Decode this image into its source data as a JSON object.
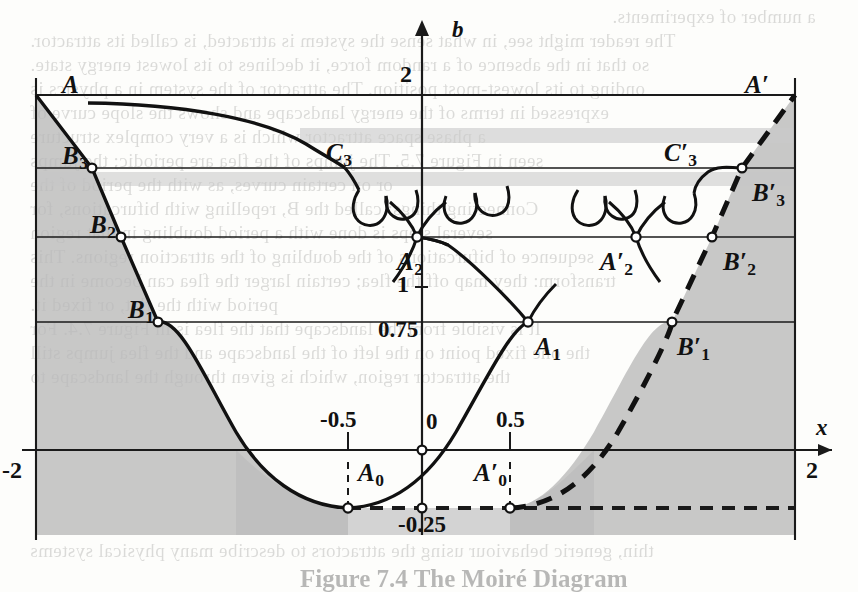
{
  "figure": {
    "caption": "Figure 7.4 The Moiré Diagram",
    "axis_x_name": "x",
    "axis_b_name": "b"
  },
  "axes": {
    "x_ticks": [
      {
        "label": "-2",
        "x": -2,
        "pos": 36,
        "side": "left"
      },
      {
        "label": "-0.5",
        "x": -0.5,
        "pos": 348,
        "side": "tick"
      },
      {
        "label": "0",
        "x": 0,
        "pos": 422,
        "side": "origin"
      },
      {
        "label": "0.5",
        "x": 0.5,
        "pos": 510,
        "side": "tick"
      },
      {
        "label": "2",
        "x": 2,
        "pos": 795,
        "side": "right"
      }
    ],
    "b_ticks": [
      {
        "label": "2",
        "b": 2,
        "pos": 95
      },
      {
        "label": "1",
        "b": 1,
        "pos": 287
      },
      {
        "label": "0.75",
        "b": 0.75,
        "pos": 331
      },
      {
        "label": "0",
        "b": 0,
        "pos": 450
      },
      {
        "label": "-0.25",
        "b": -0.25,
        "pos": 508
      }
    ]
  },
  "levels": [
    {
      "name": "b = 2",
      "y": 95,
      "style": "solid"
    },
    {
      "name": "B3-level",
      "y": 168,
      "style": "solid"
    },
    {
      "name": "B2-level",
      "y": 237,
      "style": "solid"
    },
    {
      "name": "B1-level",
      "y": 322,
      "style": "solid"
    },
    {
      "name": "x-axis",
      "y": 450,
      "style": "solid-arrow"
    },
    {
      "name": "b = -0.25",
      "y": 508,
      "style": "dashed"
    }
  ],
  "points": [
    {
      "label": "A",
      "prime": false,
      "x": 36,
      "y": 95,
      "lx": 62,
      "ly": 72,
      "marker": false
    },
    {
      "label": "A",
      "prime": true,
      "x": 795,
      "y": 95,
      "lx": 745,
      "ly": 72,
      "marker": false
    },
    {
      "label": "B",
      "sub": "3",
      "prime": false,
      "x": 92,
      "y": 168,
      "lx": 62,
      "ly": 143,
      "marker": true
    },
    {
      "label": "B",
      "sub": "3",
      "prime": true,
      "x": 742,
      "y": 168,
      "lx": 752,
      "ly": 180,
      "marker": true
    },
    {
      "label": "B",
      "sub": "2",
      "prime": false,
      "x": 121,
      "y": 237,
      "lx": 90,
      "ly": 212,
      "marker": true
    },
    {
      "label": "B",
      "sub": "2",
      "prime": true,
      "x": 712,
      "y": 237,
      "lx": 723,
      "ly": 249,
      "marker": true
    },
    {
      "label": "B",
      "sub": "1",
      "prime": false,
      "x": 158,
      "y": 322,
      "lx": 128,
      "ly": 297,
      "marker": true
    },
    {
      "label": "B",
      "sub": "1",
      "prime": true,
      "x": 672,
      "y": 322,
      "lx": 677,
      "ly": 334,
      "marker": true
    },
    {
      "label": "C",
      "sub": "3",
      "prime": false,
      "x": 345,
      "y": 168,
      "lx": 326,
      "ly": 140,
      "marker": false
    },
    {
      "label": "C",
      "sub": "3",
      "prime": true,
      "x": 690,
      "y": 168,
      "lx": 664,
      "ly": 140,
      "marker": false
    },
    {
      "label": "A",
      "sub": "2",
      "prime": false,
      "x": 417,
      "y": 237,
      "lx": 397,
      "ly": 249,
      "marker": true
    },
    {
      "label": "A",
      "sub": "2",
      "prime": true,
      "x": 636,
      "y": 237,
      "lx": 600,
      "ly": 249,
      "marker": true
    },
    {
      "label": "A",
      "sub": "1",
      "prime": false,
      "x": 528,
      "y": 322,
      "lx": 535,
      "ly": 334,
      "marker": true
    },
    {
      "label": "A",
      "sub": "0",
      "prime": false,
      "x": 348,
      "y": 508,
      "lx": 358,
      "ly": 460,
      "marker": true
    },
    {
      "label": "A",
      "sub": "0",
      "prime": true,
      "x": 510,
      "y": 508,
      "lx": 474,
      "ly": 460,
      "marker": true
    }
  ],
  "chart_data": {
    "type": "line",
    "title": "Figure 7.4 The Moiré Diagram",
    "xlabel": "x",
    "ylabel": "b",
    "xlim": [
      -2,
      2
    ],
    "ylim": [
      -0.25,
      2
    ],
    "grid": false,
    "legend": null,
    "series": [
      {
        "name": "principal-parabola-solid",
        "note": "solid curve b = x^2 - ... descending from A at (-2,2) to minimum A0 at (-0.5,-0.25) then rising through origin",
        "style": "solid"
      },
      {
        "name": "mirror-parabola-dashed",
        "note": "dashed mirror curve from A'0 at (0.5,-0.25) rising to A' at (2,2)",
        "style": "dashed"
      },
      {
        "name": "period-doubling-forks",
        "note": "pitchfork bifurcation arcs between b-levels 0.75, 1, B2-level and B3-level",
        "style": "solid"
      }
    ],
    "shaded_regions": [
      {
        "name": "left-escape-region",
        "note": "grey fill left of descending solid curve"
      },
      {
        "name": "right-escape-region",
        "note": "grey fill right of dashed rising curve"
      },
      {
        "name": "bottom-band",
        "note": "grey band below x-axis inside parabola"
      }
    ],
    "annotated_values": [
      "2",
      "1",
      "0.75",
      "0",
      "-0.25",
      "-2",
      "-0.5",
      "0.5",
      "2"
    ]
  },
  "ghost_text": {
    "note": "faint show-through text from reverse side of the printed page",
    "lines": [
      {
        "t": "a number of experiments.",
        "x": 612,
        "y": 6,
        "s": 19
      },
      {
        "t": "The reader might see, in what sense the system is attracted, is called its attractor.",
        "x": 30,
        "y": 30,
        "s": 19
      },
      {
        "t": "so that in the absence of a random force, it declines to its lowest energy state.",
        "x": 30,
        "y": 54,
        "s": 19
      },
      {
        "t": "onding to its lowest-most position. The attractor of the system in a physics is",
        "x": 30,
        "y": 78,
        "s": 19
      },
      {
        "t": "expressed in terms of the energy landscape and shows the slope curve of",
        "x": 30,
        "y": 102,
        "s": 19
      },
      {
        "t": "a phase space attractor which is a very complex structure",
        "x": 30,
        "y": 126,
        "s": 19
      },
      {
        "t": "seen in Figure 7.5. The jumps of the flea are periodic; the jumps",
        "x": 30,
        "y": 150,
        "s": 19
      },
      {
        "t": "or on certain curves, as with the period of the",
        "x": 30,
        "y": 174,
        "s": 19
      },
      {
        "t": "Connecting things: called the B, repelling with bifurcations, for",
        "x": 30,
        "y": 198,
        "s": 19
      },
      {
        "t": "several steps is done with a period doubling in that region",
        "x": 30,
        "y": 222,
        "s": 19
      },
      {
        "t": "sequence of bifurcations of the doubling of the attraction regions. This",
        "x": 30,
        "y": 246,
        "s": 19
      },
      {
        "t": "transform: they map off the flea; certain larger the flea can become in the",
        "x": 30,
        "y": 270,
        "s": 19
      },
      {
        "t": "period with the flat, or fixed it.",
        "x": 30,
        "y": 294,
        "s": 19
      },
      {
        "t": "It is visible from the landscape that the flea is in Figure 7.4. For",
        "x": 30,
        "y": 318,
        "s": 19
      },
      {
        "t": "the one fixed point on the left of the landscape and the flea jumps still",
        "x": 30,
        "y": 342,
        "s": 19
      },
      {
        "t": "the attractor region, which is given through the landscape to",
        "x": 30,
        "y": 366,
        "s": 19
      },
      {
        "t": "thin, generic behaviour using the attractors to describe many physical systems",
        "x": 30,
        "y": 540,
        "s": 19
      }
    ]
  }
}
